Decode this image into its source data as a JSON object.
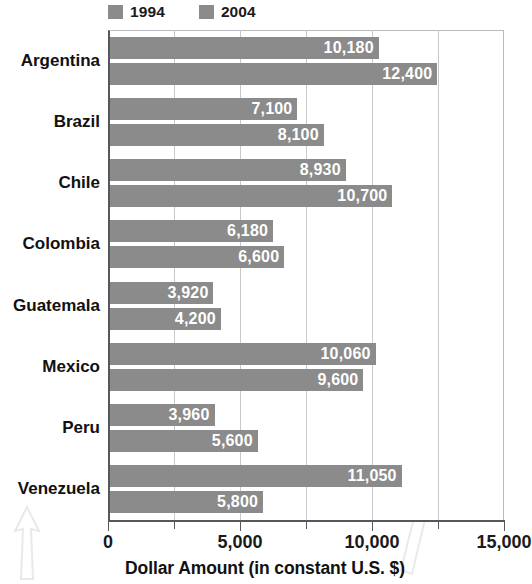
{
  "legend": {
    "items": [
      {
        "label": "1994",
        "color": "#8b8b8b"
      },
      {
        "label": "2004",
        "color": "#8b8b8b"
      }
    ]
  },
  "axis": {
    "title": "Dollar Amount (in constant U.S. $)",
    "ticks": [
      "0",
      "5,000",
      "10,000",
      "15,000"
    ]
  },
  "chart_data": {
    "type": "bar",
    "orientation": "horizontal",
    "title": "",
    "xlabel": "Dollar Amount (in constant U.S. $)",
    "ylabel": "",
    "xlim": [
      0,
      15000
    ],
    "xticks": [
      0,
      5000,
      10000,
      15000
    ],
    "minor_tick_interval": 2500,
    "grid": "vertical-minor",
    "legend_position": "top-left",
    "bar_color": "#8b8b8b",
    "value_label_color": "#ffffff",
    "categories": [
      "Argentina",
      "Brazil",
      "Chile",
      "Colombia",
      "Guatemala",
      "Mexico",
      "Peru",
      "Venezuela"
    ],
    "series": [
      {
        "name": "1994",
        "values": [
          10180,
          7100,
          8930,
          6180,
          3920,
          10060,
          3960,
          11050
        ],
        "labels": [
          "10,180",
          "7,100",
          "8,930",
          "6,180",
          "3,920",
          "10,060",
          "3,960",
          "11,050"
        ]
      },
      {
        "name": "2004",
        "values": [
          12400,
          8100,
          10700,
          6600,
          4200,
          9600,
          5600,
          5800
        ],
        "labels": [
          "12,400",
          "8,100",
          "10,700",
          "6,600",
          "4,200",
          "9,600",
          "5,600",
          "5,800"
        ]
      }
    ]
  }
}
